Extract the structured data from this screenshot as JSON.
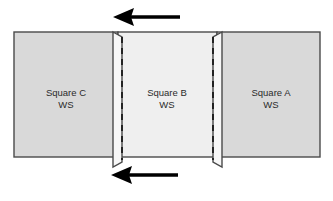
{
  "diagram": {
    "canvas": {
      "width": 333,
      "height": 201
    },
    "colors": {
      "outer_panel_fill": "#d9d9d9",
      "center_panel_fill": "#efefef",
      "flap_fill": "#f7f7f7",
      "outline": "#4a4a4a",
      "stitch_line": "#1a1a1a",
      "arrow": "#000000",
      "label_text": "#2b2b2b",
      "background": "#ffffff"
    },
    "panels": [
      {
        "id": "panel-c",
        "name": "Square C",
        "label_line1": "Square C",
        "label_line2": "WS",
        "fill": "#d9d9d9",
        "x": 14,
        "y": 32,
        "width": 104,
        "height": 125,
        "label_x": 66,
        "label_y1": 93,
        "label_y2": 105
      },
      {
        "id": "panel-b",
        "name": "Square B",
        "label_line1": "Square B",
        "label_line2": "WS",
        "fill": "#efefef",
        "x": 118,
        "y": 32,
        "width": 99,
        "height": 125,
        "label_x": 167,
        "label_y1": 93,
        "label_y2": 105
      },
      {
        "id": "panel-a",
        "name": "Square A",
        "label_line1": "Square A",
        "label_line2": "WS",
        "fill": "#d9d9d9",
        "x": 217,
        "y": 32,
        "width": 103,
        "height": 125,
        "label_x": 271,
        "label_y1": 93,
        "label_y2": 105
      }
    ],
    "seam_flaps": [
      {
        "id": "flap-left",
        "side": "left",
        "points": "113,32 122,37 122,162 113,167",
        "fill": "#f7f7f7"
      },
      {
        "id": "flap-right",
        "side": "right",
        "points": "222,32 213,37 213,162 222,167",
        "fill": "#f7f7f7"
      }
    ],
    "stitch_lines": [
      {
        "id": "stitch-line-left",
        "x": 122,
        "y1": 37,
        "y2": 160
      },
      {
        "id": "stitch-line-right",
        "x": 213,
        "y1": 37,
        "y2": 160
      }
    ],
    "arrows": [
      {
        "id": "arrow-top",
        "direction": "left",
        "tail_x": 180,
        "head_x": 116,
        "y": 17,
        "shaft_width": 3,
        "head_length": 17,
        "head_half_height": 9
      },
      {
        "id": "arrow-bottom",
        "direction": "left",
        "tail_x": 178,
        "head_x": 114,
        "y": 175,
        "shaft_width": 3,
        "head_length": 17,
        "head_half_height": 9
      }
    ]
  }
}
